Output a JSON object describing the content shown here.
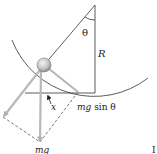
{
  "diagram": {
    "labels": {
      "angle": "θ",
      "radius": "R",
      "displacement": "x",
      "tangential_force_prefix": "mg",
      "tangential_force_suffix": " sin θ",
      "weight": "mg",
      "corner_mark": "I"
    },
    "colors": {
      "line": "#333333",
      "arrow": "#b8b8b8",
      "dash": "#444444",
      "ball_light": "#f0f0f0",
      "ball_dark": "#9a9a9a",
      "text": "#222222"
    }
  }
}
